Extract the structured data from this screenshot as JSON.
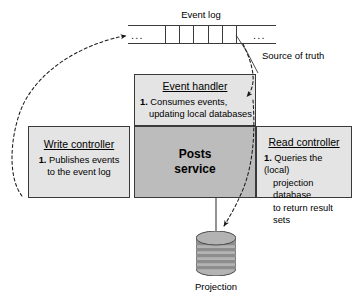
{
  "diagram": {
    "background": "#ffffff",
    "stroke_color": "#3a3a3a",
    "box_fill_light": "#e4e4e4",
    "box_fill_dark": "#bcbcbc",
    "cylinder_fill": "#b5b5b5",
    "cylinder_band": "#8f8f8f"
  },
  "event_log": {
    "title": "Event log",
    "cell_count": 7,
    "ellipsis_left": "...",
    "ellipsis_right": "...",
    "annotation": "Source of truth"
  },
  "event_handler": {
    "title": "Event handler",
    "item_number": "1.",
    "line1": "Consumes events,",
    "line2": "updating local databases"
  },
  "write_controller": {
    "title": "Write controller",
    "item_number": "1.",
    "line1": "Publishes events",
    "line2": "to the event log"
  },
  "posts_service": {
    "line1": "Posts",
    "line2": "service"
  },
  "read_controller": {
    "title": "Read controller",
    "item_number": "1.",
    "line1": "Queries the (local)",
    "line2": "projection database",
    "line3": "to return result sets"
  },
  "projection": {
    "label": "Projection",
    "band_count": 6
  },
  "connectors": [
    {
      "name": "write-controller-to-event-log",
      "from": "write-controller",
      "to": "event-log",
      "style": "dashed-curve",
      "arrow_at": "event-log"
    },
    {
      "name": "event-log-to-event-handler",
      "from": "event-log",
      "to": "event-handler",
      "style": "dashed-curve",
      "arrow_at": "event-handler"
    },
    {
      "name": "read-controller-to-projection",
      "from": "read-controller",
      "to": "projection",
      "style": "dashed-curve",
      "arrow_at": "projection"
    },
    {
      "name": "posts-service-to-projection",
      "from": "posts-service",
      "to": "projection",
      "style": "solid-line",
      "arrow_at": "none"
    },
    {
      "name": "source-of-truth-leader",
      "from": "source-of-truth-label",
      "to": "event-log",
      "style": "solid-leader",
      "arrow_at": "none"
    }
  ]
}
